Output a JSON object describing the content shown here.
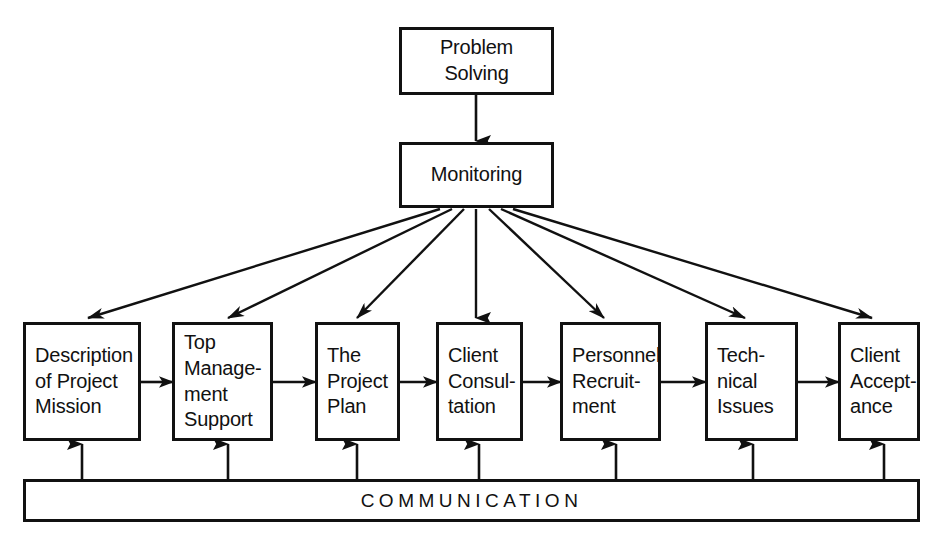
{
  "diagram": {
    "background_color": "#ffffff",
    "line_color": "#111111",
    "box_fill": "#ffffff",
    "top_nodes": [
      {
        "id": "problem-solving",
        "lines": [
          "Problem",
          "Solving"
        ],
        "align": "center",
        "x": 399,
        "y": 27,
        "w": 155,
        "h": 68
      },
      {
        "id": "monitoring",
        "lines": [
          "Monitoring"
        ],
        "align": "center",
        "x": 399,
        "y": 142,
        "w": 155,
        "h": 66
      }
    ],
    "stage_nodes": [
      {
        "id": "description-of-project-mission",
        "lines": [
          "Description",
          "of Project",
          "Mission"
        ],
        "align": "left",
        "x": 23,
        "y": 322,
        "w": 118,
        "h": 119
      },
      {
        "id": "top-management-support",
        "lines": [
          "Top",
          "Manage-",
          "ment",
          "Support"
        ],
        "align": "left",
        "x": 172,
        "y": 322,
        "w": 101,
        "h": 119
      },
      {
        "id": "the-project-plan",
        "lines": [
          "The",
          "Project",
          "Plan"
        ],
        "align": "left",
        "x": 315,
        "y": 322,
        "w": 85,
        "h": 119
      },
      {
        "id": "client-consultation",
        "lines": [
          "Client",
          "Consul-",
          "tation"
        ],
        "align": "left",
        "x": 436,
        "y": 322,
        "w": 87,
        "h": 119
      },
      {
        "id": "personnel-recruitment",
        "lines": [
          "Personnel",
          "Recruit-",
          "ment"
        ],
        "align": "left",
        "x": 560,
        "y": 322,
        "w": 101,
        "h": 119
      },
      {
        "id": "technical-issues",
        "lines": [
          "Tech-",
          "nical",
          "Issues"
        ],
        "align": "left",
        "x": 705,
        "y": 322,
        "w": 93,
        "h": 119
      },
      {
        "id": "client-acceptance",
        "lines": [
          "Client",
          "Accept-",
          "ance"
        ],
        "align": "left",
        "x": 838,
        "y": 322,
        "w": 82,
        "h": 119
      }
    ],
    "communication": {
      "id": "communication-bar",
      "label": "COMMUNICATION",
      "x": 23,
      "y": 479,
      "w": 897,
      "h": 43
    },
    "connections": {
      "problem_to_monitoring": {
        "from": "problem-solving",
        "to": "monitoring",
        "type": "vertical-arrow"
      },
      "monitoring_fanout": {
        "from": "monitoring",
        "to": [
          "description-of-project-mission",
          "top-management-support",
          "the-project-plan",
          "client-consultation",
          "personnel-recruitment",
          "technical-issues",
          "client-acceptance"
        ],
        "type": "fan-out-arrows"
      },
      "stage_chain": {
        "type": "horizontal-arrows",
        "sequence": [
          "description-of-project-mission",
          "top-management-support",
          "the-project-plan",
          "client-consultation",
          "personnel-recruitment",
          "technical-issues",
          "client-acceptance"
        ]
      },
      "communication_feeds": {
        "from": "communication-bar",
        "to": [
          "description-of-project-mission",
          "top-management-support",
          "the-project-plan",
          "client-consultation",
          "personnel-recruitment",
          "technical-issues",
          "client-acceptance"
        ],
        "type": "upward-arrows"
      }
    }
  }
}
